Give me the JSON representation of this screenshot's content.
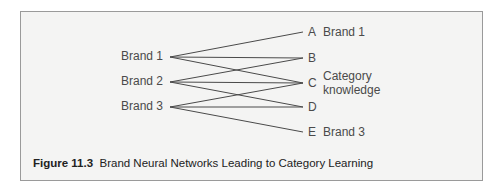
{
  "figure": {
    "number_label": "Figure 11.3",
    "title": "Brand Neural Networks Leading to Category Learning"
  },
  "left_nodes": [
    {
      "id": "b1",
      "label": "Brand 1",
      "x": 170,
      "y": 57
    },
    {
      "id": "b2",
      "label": "Brand 2",
      "x": 170,
      "y": 82
    },
    {
      "id": "b3",
      "label": "Brand 3",
      "x": 170,
      "y": 107
    }
  ],
  "right_nodes": [
    {
      "id": "A",
      "letter": "A",
      "desc": "Brand 1",
      "x": 303,
      "y": 32
    },
    {
      "id": "B",
      "letter": "B",
      "desc": "",
      "x": 303,
      "y": 58
    },
    {
      "id": "C",
      "letter": "C",
      "desc": "Category knowledge",
      "desc_line1": "Category",
      "desc_line2": "knowledge",
      "x": 303,
      "y": 83
    },
    {
      "id": "D",
      "letter": "D",
      "desc": "",
      "x": 303,
      "y": 107
    },
    {
      "id": "E",
      "letter": "E",
      "desc": "Brand 3",
      "x": 303,
      "y": 132
    }
  ],
  "edges": [
    [
      "b1",
      "A"
    ],
    [
      "b1",
      "B"
    ],
    [
      "b1",
      "C"
    ],
    [
      "b2",
      "B"
    ],
    [
      "b2",
      "C"
    ],
    [
      "b2",
      "D"
    ],
    [
      "b3",
      "C"
    ],
    [
      "b3",
      "D"
    ],
    [
      "b3",
      "E"
    ]
  ],
  "colors": {
    "line": "#4a4a4a",
    "box_bg": "#f4f4f3",
    "box_border": "#9a9a9a",
    "text": "#4a4a4a",
    "caption": "#222222"
  }
}
